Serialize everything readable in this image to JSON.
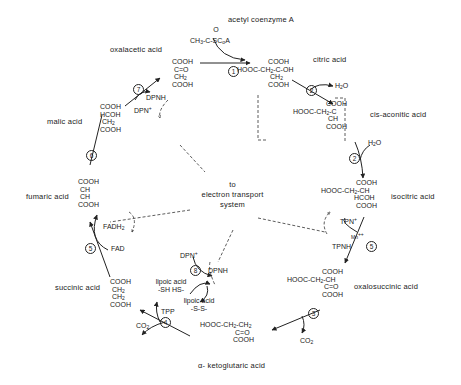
{
  "center_label": [
    "to",
    "electron transport",
    "system"
  ],
  "compounds": {
    "acetyl_coa": {
      "name": "acetyl coenzyme A",
      "formula": [
        "O",
        "CH3-C-SCoA"
      ]
    },
    "oxalacetic": {
      "name": "oxalacetic acid",
      "formula": [
        "COOH",
        "C=O",
        "CH2",
        "COOH"
      ]
    },
    "citric": {
      "name": "citric acid",
      "formula": [
        "COOH",
        "HOOC-CH2-C-OH",
        "CH2",
        "COOH"
      ]
    },
    "cis_aconitic": {
      "name": "cis-aconitic acid",
      "formula": [
        "COOH",
        "HOOC-CH2-C",
        "CH",
        "COOH"
      ]
    },
    "isocitric": {
      "name": "isocitric acid",
      "formula": [
        "COOH",
        "HOOC-CH2-CH",
        "HCOH",
        "COOH"
      ]
    },
    "oxalosuccinic": {
      "name": "oxalosuccinic acid",
      "formula": [
        "COOH",
        "HOOC-CH2-CH",
        "C=O",
        "COOH"
      ]
    },
    "ketoglutaric": {
      "name": "α- ketoglutaric acid",
      "formula": [
        "HOOC-CH2-CH2",
        "C=O",
        "COOH"
      ]
    },
    "succinic": {
      "name": "succinic acid",
      "formula": [
        "COOH",
        "CH2",
        "CH2",
        "COOH"
      ]
    },
    "fumaric": {
      "name": "fumaric acid",
      "formula": [
        "COOH",
        "CH",
        "CH",
        "COOH"
      ]
    },
    "malic": {
      "name": "malic acid",
      "formula": [
        "COOH",
        "HCOH",
        "CH2",
        "COOH"
      ]
    }
  },
  "cofactors": {
    "h2o_1": "H2O",
    "h2o_2": "H2O",
    "tpn_plus": "TPN+",
    "tpnh": "TPNH",
    "mn": "Mn++",
    "co2_1": "CO2",
    "co2_2": "CO2",
    "tpp": "TPP",
    "dpn_plus_8": "DPN+",
    "dpnh_8": "DPNH",
    "lipoic_reduced": [
      "lipoic acid",
      "-SH  HS-"
    ],
    "lipoic_oxidized": [
      "lipoic acid",
      "-S-S-"
    ],
    "fadh2": "FADH2",
    "fad": "FAD",
    "dpn_plus_7": "DPN+",
    "dpnh_7": "DPNH"
  },
  "steps": [
    "1",
    "2",
    "2",
    "3",
    "4",
    "5",
    "6",
    "7",
    "8",
    "5"
  ]
}
